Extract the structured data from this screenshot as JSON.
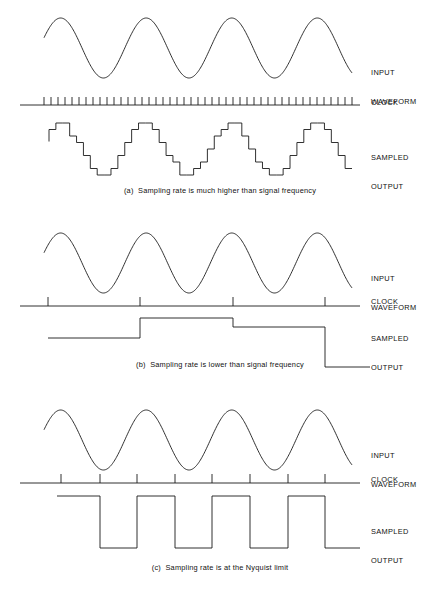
{
  "figure": {
    "background_color": "#ffffff",
    "line_color": "#1a1a1a",
    "text_color": "#111111",
    "width": 440,
    "height": 593
  },
  "labels": {
    "input_waveform_line1": "INPUT",
    "input_waveform_line2": "WAVEFORM",
    "clock": "CLOCK",
    "sampled_output_line1": "SAMPLED",
    "sampled_output_line2": "OUTPUT"
  },
  "panels": [
    {
      "id": "a",
      "caption": "(a)  Sampling rate is much higher than signal frequency",
      "input_waveform": {
        "type": "sine",
        "cycles": 3.6,
        "phase_deg": 20,
        "x_start": 44,
        "x_end": 352,
        "amplitude": 30,
        "center_y": 48
      },
      "clock": {
        "pulse_count": 45,
        "x_start": 44,
        "x_end": 352,
        "baseline_y": 105,
        "tick_height": 8
      },
      "sampled_output": {
        "type": "staircase",
        "steps_per_cycle": 12,
        "total_steps": 44,
        "quantization_levels": 9,
        "x_start": 49,
        "x_end": 352,
        "baseline_y": 175,
        "amplitude": 26
      }
    },
    {
      "id": "b",
      "caption": "(b)  Sampling rate is lower than signal frequency",
      "input_waveform": {
        "type": "sine",
        "cycles": 3.6,
        "phase_deg": 20,
        "x_start": 44,
        "x_end": 352,
        "amplitude": 30,
        "center_y": 263
      },
      "clock": {
        "pulse_count": 4,
        "tick_x": [
          48,
          140,
          233,
          325
        ],
        "x_start": 20,
        "x_end": 360,
        "baseline_y": 306,
        "tick_height": 9
      },
      "sampled_output": {
        "type": "step-levels",
        "segments": [
          {
            "x_start": 48,
            "x_end": 140,
            "level": "mid"
          },
          {
            "x_start": 140,
            "x_end": 233,
            "level": "high"
          },
          {
            "x_start": 233,
            "x_end": 325,
            "level": "mid-high"
          },
          {
            "x_start": 325,
            "x_end": 370,
            "level": "low"
          }
        ],
        "level_y": {
          "high": 318,
          "mid-high": 327,
          "mid": 338,
          "low": 367
        }
      }
    },
    {
      "id": "c",
      "caption": "(c)  Sampling rate is at the Nyquist limit",
      "input_waveform": {
        "type": "sine",
        "cycles": 3.6,
        "phase_deg": 20,
        "x_start": 44,
        "x_end": 352,
        "amplitude": 30,
        "center_y": 440
      },
      "clock": {
        "pulse_count": 8,
        "tick_x": [
          61,
          100,
          137,
          175,
          212,
          250,
          288,
          325
        ],
        "x_start": 20,
        "x_end": 360,
        "baseline_y": 483,
        "tick_height": 9
      },
      "sampled_output": {
        "type": "square",
        "high_y": 496,
        "low_y": 548,
        "x_start": 57,
        "x_end": 360,
        "transitions": [
          100,
          137,
          175,
          212,
          250,
          288,
          325
        ],
        "starts_high": true
      }
    }
  ]
}
